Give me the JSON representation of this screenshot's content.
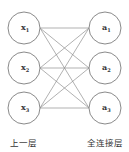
{
  "diagram": {
    "type": "fully-connected-layer",
    "input_layer": {
      "label": "上一层",
      "nodes": [
        {
          "name": "x",
          "sub": "1",
          "cx": 24,
          "cy": 28
        },
        {
          "name": "x",
          "sub": "2",
          "cx": 24,
          "cy": 68
        },
        {
          "name": "x",
          "sub": "3",
          "cx": 24,
          "cy": 108
        }
      ]
    },
    "output_layer": {
      "label": "全连接层",
      "nodes": [
        {
          "name": "a",
          "sub": "1",
          "cx": 105,
          "cy": 28
        },
        {
          "name": "a",
          "sub": "2",
          "cx": 105,
          "cy": 68
        },
        {
          "name": "a",
          "sub": "3",
          "cx": 105,
          "cy": 108
        }
      ]
    },
    "node_radius": 16,
    "edges": "all-to-all"
  }
}
